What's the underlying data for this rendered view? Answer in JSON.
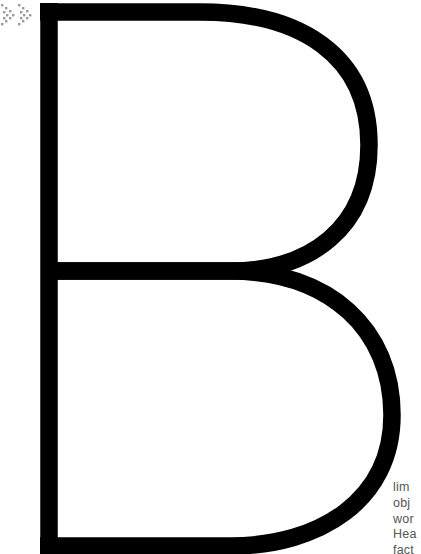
{
  "decoration": {
    "icon": "double-chevron-right-dotted",
    "icon_color": "#9a9a9a"
  },
  "display_letter": {
    "glyph": "B",
    "stroke_color": "#000000",
    "background": "#ffffff"
  },
  "text_snippet": {
    "color": "#555555",
    "lines": [
      "lim",
      "obj",
      "wor",
      "Hea",
      "fact"
    ]
  }
}
